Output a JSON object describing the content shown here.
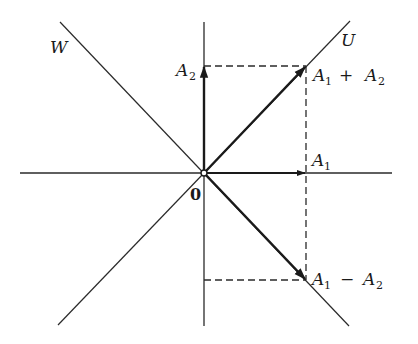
{
  "diagram": {
    "labels": {
      "W": "W",
      "U": "U",
      "A2_main": "A",
      "A2_sub": "2",
      "A1_main": "A",
      "A1_sub": "1",
      "sum_a": "A",
      "sum_a_sub": "1",
      "sum_op": "+",
      "sum_b": "A",
      "sum_b_sub": "2",
      "diff_a": "A",
      "diff_a_sub": "1",
      "diff_op": "−",
      "diff_b": "A",
      "diff_b_sub": "2",
      "origin": "0"
    },
    "elements": {
      "axes": [
        "horizontal axis",
        "vertical axis"
      ],
      "diagonal_lines": [
        "W (slope -1)",
        "U (slope +1)"
      ],
      "vectors": [
        "A1",
        "A2",
        "A1 + A2",
        "A1 - A2"
      ],
      "dashed_guides": [
        "projection rectangle lines"
      ]
    }
  }
}
